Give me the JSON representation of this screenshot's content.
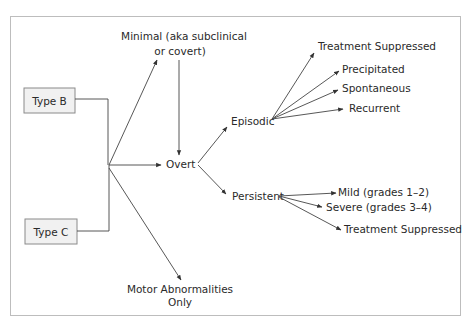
{
  "diagram": {
    "type": "flow/classification tree",
    "sources": [
      {
        "id": "type_b",
        "label": "Type B"
      },
      {
        "id": "type_c",
        "label": "Type C"
      }
    ],
    "nodes": {
      "minimal": {
        "line1": "Minimal (aka subclinical",
        "line2": "or covert)"
      },
      "overt": {
        "label": "Overt"
      },
      "motor": {
        "line1": "Motor Abnormalities",
        "line2": "Only"
      },
      "episodic": {
        "label": "Episodic"
      },
      "persistent": {
        "label": "Persistent"
      },
      "episodic_children": [
        {
          "label": "Treatment Suppressed"
        },
        {
          "label": "Precipitated"
        },
        {
          "label": "Spontaneous"
        },
        {
          "label": "Recurrent"
        }
      ],
      "persistent_children": [
        {
          "label": "Mild (grades 1–2)"
        },
        {
          "label": "Severe (grades 3–4)"
        },
        {
          "label": "Treatment Suppressed"
        }
      ]
    },
    "edges": [
      [
        "Type B",
        "junction"
      ],
      [
        "Type C",
        "junction"
      ],
      [
        "junction",
        "Minimal (aka subclinical or covert)"
      ],
      [
        "junction",
        "Overt"
      ],
      [
        "junction",
        "Motor Abnormalities Only"
      ],
      [
        "Minimal (aka subclinical or covert)",
        "Overt"
      ],
      [
        "Overt",
        "Episodic"
      ],
      [
        "Overt",
        "Persistent"
      ],
      [
        "Episodic",
        "Treatment Suppressed"
      ],
      [
        "Episodic",
        "Precipitated"
      ],
      [
        "Episodic",
        "Spontaneous"
      ],
      [
        "Episodic",
        "Recurrent"
      ],
      [
        "Persistent",
        "Mild (grades 1–2)"
      ],
      [
        "Persistent",
        "Severe (grades 3–4)"
      ],
      [
        "Persistent",
        "Treatment Suppressed"
      ]
    ],
    "colors": {
      "box_fill": "#f1f1f1",
      "box_stroke": "#8a8a8a",
      "line": "#444444",
      "frame": "#bdbdbd",
      "text": "#2a2a2a"
    }
  }
}
